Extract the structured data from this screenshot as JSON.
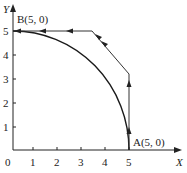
{
  "diagram": {
    "axes": {
      "x_label": "X",
      "y_label": "Y",
      "origin_label": "0",
      "x_ticks": [
        "1",
        "2",
        "3",
        "4",
        "5"
      ],
      "y_ticks": [
        "1",
        "2",
        "3",
        "4",
        "5"
      ]
    },
    "points": {
      "A": "A(5, 0)",
      "B": "B(5, 0)"
    },
    "curves": [
      {
        "name": "circular-arc",
        "description": "arc from A(5,0) to B(0,5) radius 5"
      },
      {
        "name": "polyline-path",
        "points": [
          [
            5,
            0
          ],
          [
            5,
            3.2
          ],
          [
            3.3,
            5
          ],
          [
            0,
            5
          ]
        ],
        "arrows": "direction A to B"
      }
    ]
  }
}
